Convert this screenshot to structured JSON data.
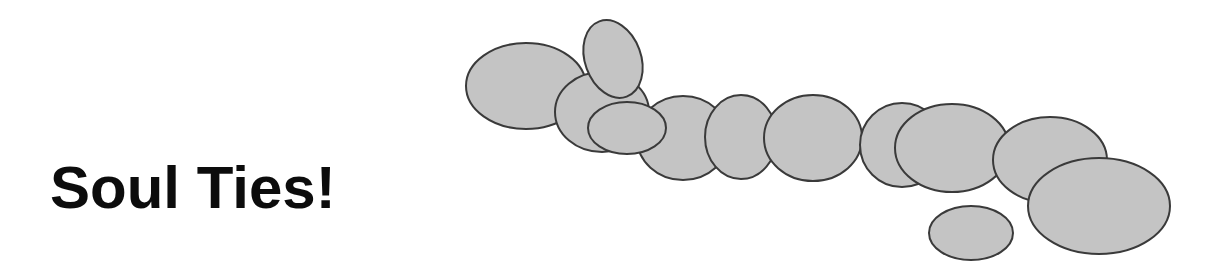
{
  "title": "Soul Ties!",
  "colors": {
    "background": "#ffffff",
    "text": "#0c0c0c",
    "ellipse_fill": "#c4c4c4",
    "ellipse_stroke": "#3a3a3a"
  },
  "ellipses": [
    {
      "id": "e1",
      "cx": 526,
      "cy": 86,
      "rx": 60,
      "ry": 43,
      "rotate": 0
    },
    {
      "id": "e3",
      "cx": 602,
      "cy": 112,
      "rx": 47,
      "ry": 40,
      "rotate": 0
    },
    {
      "id": "e2",
      "cx": 613,
      "cy": 59,
      "rx": 28,
      "ry": 40,
      "rotate": -20
    },
    {
      "id": "e5",
      "cx": 683,
      "cy": 138,
      "rx": 46,
      "ry": 42,
      "rotate": 0
    },
    {
      "id": "e4",
      "cx": 627,
      "cy": 128,
      "rx": 39,
      "ry": 26,
      "rotate": 0
    },
    {
      "id": "e6",
      "cx": 741,
      "cy": 137,
      "rx": 36,
      "ry": 42,
      "rotate": 0
    },
    {
      "id": "e7",
      "cx": 813,
      "cy": 138,
      "rx": 49,
      "ry": 43,
      "rotate": 0
    },
    {
      "id": "e8",
      "cx": 902,
      "cy": 145,
      "rx": 42,
      "ry": 42,
      "rotate": 0
    },
    {
      "id": "e9",
      "cx": 952,
      "cy": 148,
      "rx": 57,
      "ry": 44,
      "rotate": 0
    },
    {
      "id": "e10",
      "cx": 1050,
      "cy": 160,
      "rx": 57,
      "ry": 43,
      "rotate": 0
    },
    {
      "id": "e11",
      "cx": 1099,
      "cy": 206,
      "rx": 71,
      "ry": 48,
      "rotate": 0
    },
    {
      "id": "e12",
      "cx": 971,
      "cy": 233,
      "rx": 42,
      "ry": 27,
      "rotate": 0
    }
  ]
}
